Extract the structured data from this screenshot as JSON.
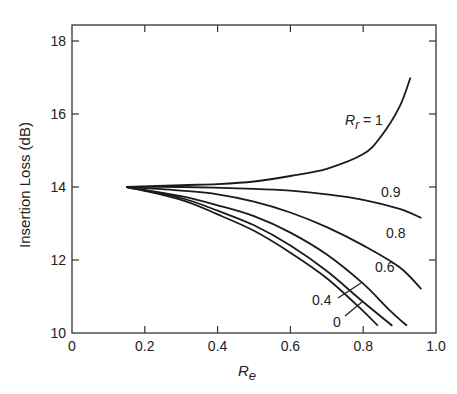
{
  "chart_data": {
    "type": "line",
    "title": "",
    "xlabel": "R_e",
    "ylabel": "Insertion Loss (dB)",
    "xlim": [
      0,
      1.0
    ],
    "ylim": [
      10,
      18.5
    ],
    "xticks": [
      0,
      0.2,
      0.4,
      0.6,
      0.8,
      1.0
    ],
    "xtick_labels": [
      "0",
      "0.2",
      "0.4",
      "0.6",
      "0.8",
      "1.0"
    ],
    "yticks": [
      10,
      12,
      14,
      16,
      18
    ],
    "ytick_labels": [
      "10",
      "12",
      "14",
      "16",
      "18"
    ],
    "grid": false,
    "legend": "inline curve labels",
    "series": [
      {
        "name": "R_r = 1",
        "label": "Rr=1",
        "x": [
          0.15,
          0.3,
          0.4,
          0.5,
          0.6,
          0.7,
          0.8,
          0.85,
          0.9,
          0.93
        ],
        "y": [
          14.0,
          14.05,
          14.08,
          14.15,
          14.3,
          14.5,
          14.9,
          15.4,
          16.2,
          17.0
        ]
      },
      {
        "name": "R_r = 0.9",
        "label": "0.9",
        "x": [
          0.15,
          0.3,
          0.5,
          0.6,
          0.7,
          0.8,
          0.9,
          0.96
        ],
        "y": [
          14.0,
          14.0,
          13.95,
          13.9,
          13.8,
          13.65,
          13.4,
          13.15
        ]
      },
      {
        "name": "R_r = 0.8",
        "label": "0.8",
        "x": [
          0.15,
          0.3,
          0.4,
          0.5,
          0.6,
          0.7,
          0.8,
          0.9,
          0.96
        ],
        "y": [
          14.0,
          13.9,
          13.8,
          13.6,
          13.3,
          12.9,
          12.4,
          11.8,
          11.2
        ]
      },
      {
        "name": "R_r = 0.6",
        "label": "0.6",
        "x": [
          0.15,
          0.3,
          0.4,
          0.5,
          0.6,
          0.7,
          0.8,
          0.87,
          0.92
        ],
        "y": [
          14.0,
          13.75,
          13.5,
          13.2,
          12.75,
          12.15,
          11.35,
          10.65,
          10.2
        ]
      },
      {
        "name": "R_r = 0.4",
        "label": "0.4",
        "x": [
          0.15,
          0.3,
          0.4,
          0.5,
          0.6,
          0.7,
          0.8,
          0.88
        ],
        "y": [
          14.0,
          13.7,
          13.35,
          12.95,
          12.4,
          11.7,
          10.85,
          10.2
        ]
      },
      {
        "name": "R_r = 0",
        "label": "0",
        "x": [
          0.15,
          0.3,
          0.4,
          0.5,
          0.6,
          0.7,
          0.8,
          0.84
        ],
        "y": [
          14.0,
          13.65,
          13.25,
          12.8,
          12.2,
          11.5,
          10.6,
          10.2
        ]
      }
    ],
    "annotations": [
      {
        "text": "R_r = 1",
        "near": "top curve, right side"
      },
      {
        "text": "0.9"
      },
      {
        "text": "0.8"
      },
      {
        "text": "0.6"
      },
      {
        "text": "0.4",
        "leader_line": true
      },
      {
        "text": "0",
        "leader_line": true
      }
    ]
  },
  "labels": {
    "ylabel": "Insertion Loss (dB)",
    "xlabel_main": "R",
    "xlabel_sub": "e",
    "rr_main": "R",
    "rr_sub": "r",
    "rr_eq": " = 1",
    "c09": "0.9",
    "c08": "0.8",
    "c06": "0.6",
    "c04": "0.4",
    "c0": "0"
  }
}
